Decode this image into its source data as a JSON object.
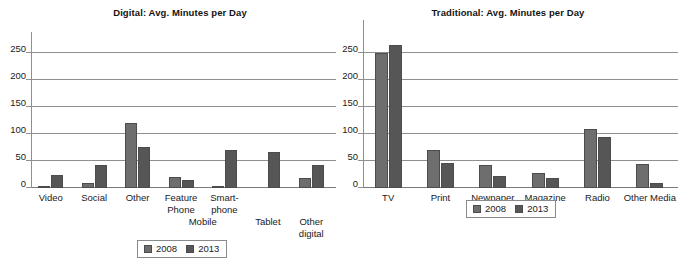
{
  "colors": {
    "series_2008": "#6e6e6e",
    "series_2013": "#565656",
    "gridline": "#8f8f8f",
    "text": "#1a1a1a",
    "background": "#ffffff"
  },
  "panels": {
    "digital": {
      "title": "Digital: Avg. Minutes per Day",
      "group_label": "Mobile",
      "legend": {
        "s2008": "2008",
        "s2013": "2013"
      },
      "yticks": [
        "0",
        "50",
        "100",
        "150",
        "200",
        "250"
      ]
    },
    "traditional": {
      "title": "Traditional: Avg. Minutes per Day",
      "legend": {
        "s2008": "2008",
        "s2013": "2013"
      },
      "yticks": [
        "0",
        "50",
        "100",
        "150",
        "200",
        "250"
      ]
    }
  },
  "labels": {
    "digital": {
      "video": "Video",
      "social": "Social",
      "other": "Other",
      "feature_phone_l1": "Feature",
      "feature_phone_l2": "Phone",
      "smartphone_l1": "Smart-",
      "smartphone_l2": "phone",
      "tablet": "Tablet",
      "other_digital_l1": "Other",
      "other_digital_l2": "digital"
    },
    "traditional": {
      "tv": "TV",
      "print": "Print",
      "newpaper": "Newpaper",
      "magazine": "Magazine",
      "radio": "Radio",
      "other_media": "Other Media"
    }
  },
  "chart_data": [
    {
      "type": "bar",
      "title": "Digital: Avg. Minutes per Day",
      "xlabel": "",
      "ylabel": "",
      "ylim": [
        0,
        275
      ],
      "yticks": [
        0,
        50,
        100,
        150,
        200,
        250
      ],
      "grid": true,
      "legend_position": "bottom",
      "categories": [
        "Video",
        "Social",
        "Other",
        "Feature Phone",
        "Smart-phone",
        "Tablet",
        "Other digital"
      ],
      "group_annotations": [
        {
          "label": "Mobile",
          "covers": [
            "Feature Phone",
            "Smart-phone"
          ]
        }
      ],
      "series": [
        {
          "name": "2008",
          "values": [
            3,
            9,
            121,
            20,
            3,
            0,
            18
          ]
        },
        {
          "name": "2013",
          "values": [
            25,
            42,
            76,
            14,
            70,
            66,
            42
          ]
        }
      ]
    },
    {
      "type": "bar",
      "title": "Traditional: Avg. Minutes per Day",
      "xlabel": "",
      "ylabel": "",
      "ylim": [
        0,
        275
      ],
      "yticks": [
        0,
        50,
        100,
        150,
        200,
        250
      ],
      "grid": true,
      "legend_position": "bottom",
      "categories": [
        "TV",
        "Print",
        "Newpaper",
        "Magazine",
        "Radio",
        "Other Media"
      ],
      "series": [
        {
          "name": "2008",
          "values": [
            250,
            70,
            43,
            28,
            110,
            45
          ]
        },
        {
          "name": "2013",
          "values": [
            265,
            47,
            22,
            18,
            95,
            10
          ]
        }
      ]
    }
  ]
}
